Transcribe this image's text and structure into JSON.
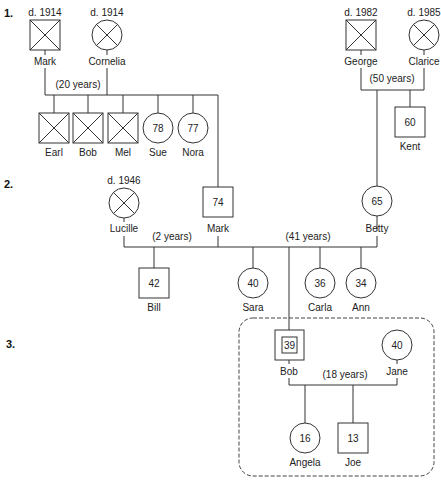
{
  "generations": [
    {
      "label": "1."
    },
    {
      "label": "2."
    },
    {
      "label": "3."
    }
  ],
  "people": {
    "mark_g1": {
      "name": "Mark",
      "note": "d. 1914",
      "sex": "male",
      "deceased": true
    },
    "cornelia": {
      "name": "Cornelia",
      "note": "d. 1914",
      "sex": "female",
      "deceased": true
    },
    "earl": {
      "name": "Earl",
      "sex": "male",
      "deceased": true
    },
    "bob_g1": {
      "name": "Bob",
      "sex": "male",
      "deceased": true
    },
    "mel": {
      "name": "Mel",
      "sex": "male",
      "deceased": true
    },
    "sue": {
      "name": "Sue",
      "age": "78",
      "sex": "female"
    },
    "nora": {
      "name": "Nora",
      "age": "77",
      "sex": "female"
    },
    "george": {
      "name": "George",
      "note": "d. 1982",
      "sex": "male",
      "deceased": true
    },
    "clarice": {
      "name": "Clarice",
      "note": "d. 1985",
      "sex": "female",
      "deceased": true
    },
    "kent": {
      "name": "Kent",
      "age": "60",
      "sex": "male"
    },
    "lucille": {
      "name": "Lucille",
      "note": "d. 1946",
      "sex": "female",
      "deceased": true
    },
    "mark_g2": {
      "name": "Mark",
      "age": "74",
      "sex": "male"
    },
    "betty": {
      "name": "Betty",
      "age": "65",
      "sex": "female"
    },
    "bill": {
      "name": "Bill",
      "age": "42",
      "sex": "male"
    },
    "sara": {
      "name": "Sara",
      "age": "40",
      "sex": "female"
    },
    "carla": {
      "name": "Carla",
      "age": "36",
      "sex": "female"
    },
    "ann": {
      "name": "Ann",
      "age": "34",
      "sex": "female"
    },
    "bob_g3": {
      "name": "Bob",
      "age": "39",
      "sex": "male",
      "identified_patient": true
    },
    "jane": {
      "name": "Jane",
      "age": "40",
      "sex": "female"
    },
    "angela": {
      "name": "Angela",
      "age": "16",
      "sex": "female"
    },
    "joe": {
      "name": "Joe",
      "age": "13",
      "sex": "male"
    }
  },
  "marriages": {
    "mark_cornelia": "(20 years)",
    "george_clarice": "(50 years)",
    "mark_lucille": "(2 years)",
    "mark_betty": "(41 years)",
    "bob_jane": "(18 years)"
  },
  "colors": {
    "line": "#333333",
    "text": "#222222",
    "background": "#ffffff"
  }
}
